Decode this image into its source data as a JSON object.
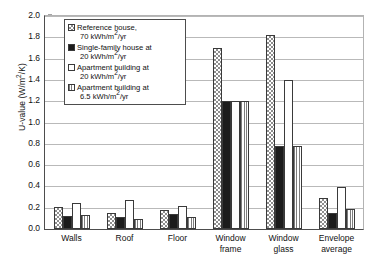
{
  "chart_data": {
    "type": "bar",
    "title": "",
    "xlabel": "",
    "ylabel": "U-value (W/m²/K)",
    "ylabel_parts": {
      "prefix": "U-value (W/m",
      "sup": "2",
      "suffix": "/K)"
    },
    "ylim": [
      0.0,
      2.0
    ],
    "ytick_step": 0.2,
    "ytick_labels": [
      "2.0",
      "1.8",
      "1.6",
      "1.4",
      "1.2",
      "1.0",
      "0.8",
      "0.6",
      "0.4",
      "0.2",
      "0.0"
    ],
    "grid": true,
    "grid_axis": "y",
    "legend_position": "upper-left-inside",
    "categories": [
      "Walls",
      "Roof",
      "Floor",
      "Window frame",
      "Window glass",
      "Envelope average"
    ],
    "category_labels": [
      "Walls",
      "Roof",
      "Floor",
      "Window\nframe",
      "Window\nglass",
      "Envelope\naverage"
    ],
    "series": [
      {
        "name": "Reference house, 70 kWh/m²/yr",
        "pattern": "checkerboard",
        "values": [
          0.21,
          0.15,
          0.18,
          1.7,
          1.82,
          0.29
        ]
      },
      {
        "name": "Single-family house at 20 kWh/m²/yr",
        "pattern": "solid-black",
        "values": [
          0.12,
          0.11,
          0.14,
          1.2,
          0.78,
          0.15
        ]
      },
      {
        "name": "Apartment building at 20 kWh/m²/yr",
        "pattern": "white",
        "values": [
          0.24,
          0.27,
          0.22,
          1.2,
          1.4,
          0.39
        ]
      },
      {
        "name": "Apartment building at 6.5 kWh/m²/yr",
        "pattern": "vertical-lines",
        "values": [
          0.13,
          0.09,
          0.11,
          1.2,
          0.78,
          0.19
        ]
      }
    ]
  },
  "legend": {
    "items": [
      {
        "line1": "Reference house,",
        "line2": "70 kWh/m",
        "sup": "2",
        "line2_suffix": "/yr"
      },
      {
        "line1": "Single-family house at",
        "line2": "20 kWh/m",
        "sup": "2",
        "line2_suffix": "/yr"
      },
      {
        "line1": "Apartment building at",
        "line2": "20 kWh/m",
        "sup": "2",
        "line2_suffix": "/yr"
      },
      {
        "line1": "Apartment building at",
        "line2": "6.5 kWh/m",
        "sup": "2",
        "line2_suffix": "/yr"
      }
    ]
  },
  "colors": {
    "axis": "#4d4d4d",
    "grid": "#b9b9b9",
    "bar_outline": "#3a3a3a",
    "series_black": "#1c1c1c",
    "series_pattern_gray": "#8e8e8e",
    "background": "#ffffff"
  }
}
